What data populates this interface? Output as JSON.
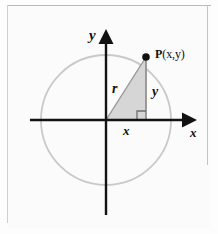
{
  "figure": {
    "kind": "math-diagram",
    "colors": {
      "background": "#fdfdfd",
      "axis": "#121212",
      "circle": "#c9c9c9",
      "triangle_fill": "#d6d6d6",
      "triangle_stroke": "#a8a8a8",
      "point": "#101010",
      "scan_rule": "#c4c4c4"
    },
    "axes": {
      "x_label": "x",
      "y_label": "y",
      "origin_px": [
        106,
        120
      ],
      "x_axis_from_px": [
        30,
        120
      ],
      "x_axis_to_px": [
        196,
        120
      ],
      "y_axis_from_px": [
        106,
        215
      ],
      "y_axis_to_px": [
        106,
        32
      ]
    },
    "circle": {
      "center_px": [
        106,
        120
      ],
      "radius_px": 65,
      "stroke_width": 1.6
    },
    "point": {
      "name": "P",
      "coords_text": "(x,y)",
      "label_full": "P(x,y)",
      "position_px": [
        146,
        57
      ],
      "dot_radius_px": 3.6
    },
    "triangle": {
      "vertices_px": [
        [
          106,
          120
        ],
        [
          146,
          57
        ],
        [
          146,
          120
        ]
      ],
      "hypotenuse_label": "r",
      "vertical_leg_label": "y",
      "horizontal_leg_label": "x",
      "right_angle_marker": true,
      "right_angle_size_px": 9
    }
  }
}
